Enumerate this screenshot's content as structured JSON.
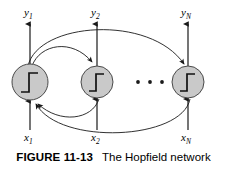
{
  "figure": {
    "caption_label": "FIGURE 11-13",
    "caption_text": "The Hopfield network",
    "colors": {
      "neuron_fill": "#c9c9c9",
      "stroke": "#1a1a1a",
      "background": "#ffffff",
      "text": "#000000"
    }
  },
  "outputs": [
    {
      "id": "y1",
      "base": "y",
      "sub": "1",
      "x": 24,
      "y": 10
    },
    {
      "id": "y2",
      "base": "y",
      "sub": "2",
      "x": 91,
      "y": 10
    },
    {
      "id": "yN",
      "base": "y",
      "sub": "N",
      "x": 181,
      "y": 10
    }
  ],
  "inputs": [
    {
      "id": "x1",
      "base": "x",
      "sub": "1",
      "x": 23,
      "y": 132
    },
    {
      "id": "x2",
      "base": "x",
      "sub": "2",
      "x": 90,
      "y": 132
    },
    {
      "id": "xN",
      "base": "x",
      "sub": "N",
      "x": 180,
      "y": 132
    }
  ],
  "neurons": [
    {
      "id": "neuron-1",
      "label": "step-function",
      "cx": 30,
      "cy": 82,
      "r": 18
    },
    {
      "id": "neuron-2",
      "label": "step-function",
      "cx": 97,
      "cy": 82,
      "r": 16
    },
    {
      "id": "neuron-n",
      "label": "step-function",
      "cx": 188,
      "cy": 82,
      "r": 16
    }
  ],
  "ellipsis": {
    "dots": 3,
    "cx": 150,
    "cy": 82
  },
  "connections": [
    {
      "id": "conn-1-to-2",
      "from": "neuron-1",
      "to": "neuron-2",
      "side": "top"
    },
    {
      "id": "conn-1-to-n",
      "from": "neuron-1",
      "to": "neuron-n",
      "side": "top"
    },
    {
      "id": "conn-2-to-1",
      "from": "neuron-2",
      "to": "neuron-1",
      "side": "bottom"
    },
    {
      "id": "conn-n-to-1",
      "from": "neuron-n",
      "to": "neuron-1",
      "side": "bottom"
    }
  ]
}
